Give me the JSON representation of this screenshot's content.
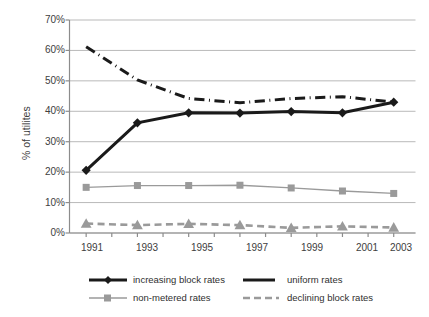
{
  "chart_data": {
    "type": "line",
    "title": "",
    "xlabel": "",
    "ylabel": "% of utilites",
    "x": [
      1991,
      1993,
      1995,
      1997,
      1999,
      2001,
      2003
    ],
    "categories": [
      "1991",
      "1993",
      "1995",
      "1997",
      "1999",
      "2001",
      "2003"
    ],
    "xtick_labels": [
      "1991",
      "1993",
      "1995",
      "1997",
      "1999",
      "2001",
      "2003"
    ],
    "ytick_labels": [
      "0%",
      "10%",
      "20%",
      "30%",
      "40%",
      "50%",
      "60%",
      "70%"
    ],
    "ytick_values": [
      0,
      10,
      20,
      30,
      40,
      50,
      60,
      70
    ],
    "ylim": [
      0,
      70
    ],
    "xlim": [
      1990.35,
      2003.85
    ],
    "grid": "horizontal",
    "legend_position": "bottom",
    "series": [
      {
        "name": "increasing block rates",
        "values": [
          20.6,
          36.2,
          39.5,
          39.4,
          39.9,
          39.5,
          43.0
        ],
        "color": "#1a1a1a",
        "style": "solid",
        "width": 3.0,
        "marker": "diamond"
      },
      {
        "name": "uniform rates",
        "values": [
          61.2,
          50.3,
          44.2,
          42.8,
          44.2,
          44.8,
          43.0
        ],
        "color": "#1a1a1a",
        "style": "dash-dot",
        "width": 3.0,
        "marker": "none"
      },
      {
        "name": "non-metered rates",
        "values": [
          15.0,
          15.6,
          15.6,
          15.7,
          14.8,
          13.8,
          13.0
        ],
        "color": "#9a9a9a",
        "style": "solid",
        "width": 1.3,
        "marker": "square"
      },
      {
        "name": "declining block rates",
        "values": [
          3.1,
          2.6,
          3.0,
          2.6,
          1.7,
          2.2,
          1.8
        ],
        "color": "#9a9a9a",
        "style": "dashed",
        "width": 2.6,
        "marker": "triangle"
      }
    ]
  },
  "axes": {
    "y_title": "% of utilites",
    "ytick_labels": [
      "70%",
      "60%",
      "50%",
      "40%",
      "30%",
      "20%",
      "10%",
      "0%"
    ],
    "xtick_labels": [
      "1991",
      "1993",
      "1995",
      "1997",
      "1999",
      "2001",
      "2003"
    ]
  },
  "legend": {
    "items": [
      {
        "label": "increasing block rates"
      },
      {
        "label": "uniform rates"
      },
      {
        "label": "non-metered rates"
      },
      {
        "label": "declining block rates"
      }
    ]
  },
  "colors": {
    "dark_line": "#1a1a1a",
    "grey_line": "#9a9a9a",
    "gridline": "#b9b9b9",
    "axis": "#8c8c8c",
    "text": "#404040"
  }
}
